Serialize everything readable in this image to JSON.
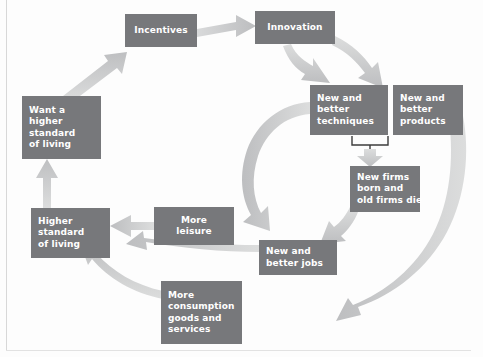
{
  "diagram": {
    "style": {
      "box_fill": "#77787b",
      "box_text": "#ffffff",
      "arrow_fill": "#c9cacb",
      "background": "#fdfdfd",
      "frame_line": "#d8d8d8"
    },
    "nodes": [
      {
        "id": "incentives",
        "lines": [
          "Incentives"
        ],
        "x": 125,
        "y": 14,
        "w": 72,
        "h": 33,
        "align": "center"
      },
      {
        "id": "innovation",
        "lines": [
          "Innovation"
        ],
        "x": 255,
        "y": 11,
        "w": 80,
        "h": 33,
        "align": "center"
      },
      {
        "id": "new-better-techniques",
        "lines": [
          "New and",
          "better",
          "techniques"
        ],
        "x": 310,
        "y": 85,
        "w": 78,
        "h": 50,
        "align": "left"
      },
      {
        "id": "new-better-products",
        "lines": [
          "New and",
          "better",
          "products"
        ],
        "x": 393,
        "y": 85,
        "w": 70,
        "h": 50,
        "align": "left"
      },
      {
        "id": "new-firms",
        "lines": [
          "New firms",
          "born and",
          "old firms die"
        ],
        "x": 350,
        "y": 166,
        "w": 70,
        "h": 46,
        "align": "left"
      },
      {
        "id": "new-better-jobs",
        "lines": [
          "New and",
          "better jobs"
        ],
        "x": 259,
        "y": 240,
        "w": 78,
        "h": 35,
        "align": "left"
      },
      {
        "id": "more-leisure",
        "lines": [
          "More",
          "leisure"
        ],
        "x": 154,
        "y": 207,
        "w": 80,
        "h": 38,
        "align": "center"
      },
      {
        "id": "more-consumption",
        "lines": [
          "More",
          "consumption",
          "goods and",
          "services"
        ],
        "x": 161,
        "y": 281,
        "w": 81,
        "h": 63,
        "align": "left"
      },
      {
        "id": "higher-standard",
        "lines": [
          "Higher",
          "standard",
          "of living"
        ],
        "x": 31,
        "y": 208,
        "w": 79,
        "h": 50,
        "align": "left"
      },
      {
        "id": "want-higher-standard",
        "lines": [
          "Want a",
          "higher",
          "standard",
          "of living"
        ],
        "x": 22,
        "y": 96,
        "w": 79,
        "h": 63,
        "align": "left"
      }
    ],
    "edges": [
      {
        "id": "incentives-to-innovation",
        "from": "incentives",
        "to": "innovation",
        "kind": "straight-right"
      },
      {
        "id": "innovation-to-techniques",
        "from": "innovation",
        "to": "new-better-techniques",
        "kind": "curve-down"
      },
      {
        "id": "innovation-to-products",
        "from": "innovation",
        "to": "new-better-products",
        "kind": "curve-down"
      },
      {
        "id": "techniques-products-to-new-firms",
        "from": "new-better-techniques+new-better-products",
        "to": "new-firms",
        "kind": "bracket-down"
      },
      {
        "id": "new-firms-to-jobs",
        "from": "new-firms",
        "to": "new-better-jobs",
        "kind": "curve-down-left"
      },
      {
        "id": "techniques-to-more-leisure",
        "from": "new-better-techniques",
        "to": "more-leisure",
        "kind": "big-curve-left"
      },
      {
        "id": "products-to-more-consumption",
        "from": "new-better-products",
        "to": "more-consumption",
        "kind": "big-curve-left"
      },
      {
        "id": "more-leisure-to-higher-standard",
        "from": "more-leisure",
        "to": "higher-standard",
        "kind": "straight-left"
      },
      {
        "id": "jobs-to-higher-standard",
        "from": "new-better-jobs",
        "to": "higher-standard",
        "kind": "curve-left"
      },
      {
        "id": "consumption-to-higher-standard",
        "from": "more-consumption",
        "to": "higher-standard",
        "kind": "curve-up-left"
      },
      {
        "id": "higher-to-want-higher",
        "from": "higher-standard",
        "to": "want-higher-standard",
        "kind": "straight-up"
      },
      {
        "id": "want-higher-to-incentives",
        "from": "want-higher-standard",
        "to": "incentives",
        "kind": "diagonal-up-right"
      }
    ]
  }
}
